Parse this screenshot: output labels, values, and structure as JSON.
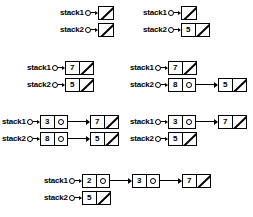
{
  "diagram": {
    "null_symbol": "diagonal-slash",
    "groups": [
      {
        "id": "state-1",
        "x": 60,
        "y": 4,
        "rows": [
          {
            "label": "stack1",
            "nodes": []
          },
          {
            "label": "stack2",
            "nodes": []
          }
        ]
      },
      {
        "id": "state-2",
        "x": 143,
        "y": 4,
        "rows": [
          {
            "label": "stack1",
            "nodes": []
          },
          {
            "label": "stack2",
            "nodes": [
              "5"
            ]
          }
        ]
      },
      {
        "id": "state-3",
        "x": 27,
        "y": 59,
        "rows": [
          {
            "label": "stack1",
            "nodes": [
              "7"
            ]
          },
          {
            "label": "stack2",
            "nodes": [
              "5"
            ]
          }
        ]
      },
      {
        "id": "state-4",
        "x": 130,
        "y": 59,
        "rows": [
          {
            "label": "stack1",
            "nodes": [
              "7"
            ]
          },
          {
            "label": "stack2",
            "nodes": [
              "8",
              "5"
            ]
          }
        ]
      },
      {
        "id": "state-5",
        "x": 2,
        "y": 113,
        "rows": [
          {
            "label": "stack1",
            "nodes": [
              "3",
              "7"
            ]
          },
          {
            "label": "stack2",
            "nodes": [
              "8",
              "5"
            ]
          }
        ]
      },
      {
        "id": "state-6",
        "x": 130,
        "y": 113,
        "rows": [
          {
            "label": "stack1",
            "nodes": [
              "3",
              "7"
            ]
          },
          {
            "label": "stack2",
            "nodes": [
              "5"
            ]
          }
        ]
      },
      {
        "id": "state-7",
        "x": 44,
        "y": 172,
        "rows": [
          {
            "label": "stack1",
            "nodes": [
              "2",
              "3",
              "7"
            ]
          },
          {
            "label": "stack2",
            "nodes": [
              "5"
            ]
          }
        ]
      }
    ]
  },
  "colors": {
    "ink": "#000000",
    "background": "#ffffff"
  }
}
